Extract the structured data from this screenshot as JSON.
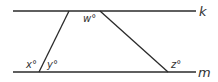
{
  "diagram": {
    "lines": [
      {
        "id": "k",
        "label": "k",
        "x1": 13,
        "y1": 11,
        "x2": 196,
        "y2": 11
      },
      {
        "id": "m",
        "label": "m",
        "x1": 13,
        "y1": 72,
        "x2": 196,
        "y2": 72
      }
    ],
    "transversals": [
      {
        "id": "left",
        "x1": 69,
        "y1": 11,
        "x2": 39,
        "y2": 72
      },
      {
        "id": "right",
        "x1": 100,
        "y1": 11,
        "x2": 168,
        "y2": 72
      }
    ],
    "angle_labels": {
      "w": "w°",
      "x": "x°",
      "y": "y°",
      "z": "z°"
    },
    "line_labels": {
      "k": "k",
      "m": "m"
    },
    "colors": {
      "stroke": "#2a2a2a",
      "text": "#333333"
    }
  }
}
